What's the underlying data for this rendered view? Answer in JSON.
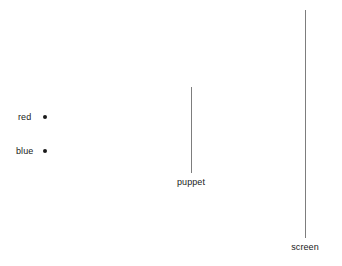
{
  "diagram": {
    "background_color": "#ffffff",
    "line_color": "#7d7d7d",
    "text_color": "#1a1a1a",
    "dot_color": "#1a1a1a",
    "sources": [
      {
        "id": "red-source",
        "label": "red",
        "x": 45,
        "y": 117,
        "label_x": 18,
        "label_y": 112
      },
      {
        "id": "blue-source",
        "label": "blue",
        "x": 45,
        "y": 151,
        "label_x": 16,
        "label_y": 146
      }
    ],
    "objects": [
      {
        "id": "puppet",
        "label": "puppet",
        "x": 191,
        "top": 87,
        "bottom": 173,
        "label_x": 171,
        "label_y": 177
      },
      {
        "id": "screen",
        "label": "screen",
        "x": 305,
        "top": 10,
        "bottom": 238,
        "label_x": 289,
        "label_y": 242
      }
    ]
  }
}
